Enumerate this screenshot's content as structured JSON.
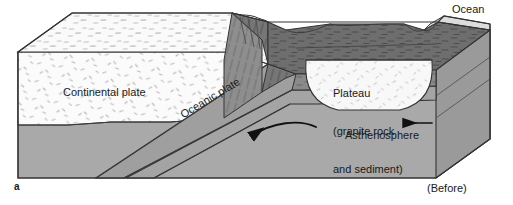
{
  "figure": {
    "panel_letter": "a",
    "caption_state": "(Before)",
    "type": "geologic block diagram"
  },
  "labels": {
    "ocean": "Ocean",
    "continental_plate": "Continental plate",
    "plateau_line1": "Plateau",
    "plateau_line2": "(granite rock",
    "plateau_line3": "and sediment)",
    "oceanic_plate": "Oceanic plate",
    "asthenosphere": "Asthenosphere"
  },
  "arrows": {
    "convection_curved": "curved arrow pointing down-left into asthenosphere",
    "plate_motion": "straight arrow pointing left"
  },
  "colors": {
    "background": "#ffffff",
    "continental_crust": "#fbfbfb",
    "oceanic_crust_dark": "#6e6e6e",
    "oceanic_crust_mid": "#8a8a8a",
    "asthenosphere": "#a9a9a9",
    "asthenosphere_side": "#9a9a9a",
    "ocean_water": "#d8d8d8",
    "plateau_fill": "#f8f8f8",
    "outline": "#333333",
    "text": "#1a1a1a"
  }
}
